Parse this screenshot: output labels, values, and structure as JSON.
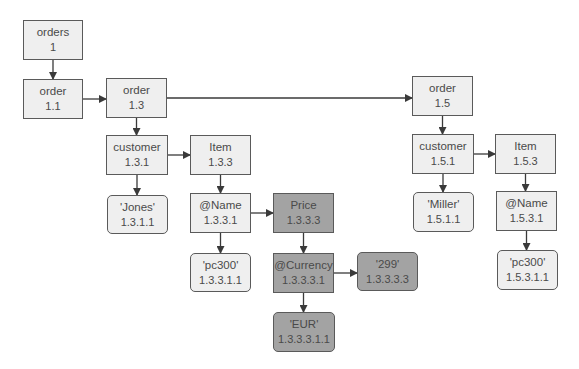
{
  "diagram": {
    "colors": {
      "node_fill": "#efefef",
      "highlight_fill": "#a3a3a3",
      "border": "#5a5a5a",
      "edge": "#3a3a3a"
    },
    "nodes": [
      {
        "key": "n1",
        "label": "orders",
        "id": "1",
        "kind": "element",
        "highlight": false,
        "x": 23,
        "y": 20,
        "w": 60,
        "h": 40
      },
      {
        "key": "n11",
        "label": "order",
        "id": "1.1",
        "kind": "element",
        "highlight": false,
        "x": 23,
        "y": 79,
        "w": 60,
        "h": 40
      },
      {
        "key": "n13",
        "label": "order",
        "id": "1.3",
        "kind": "element",
        "highlight": false,
        "x": 106,
        "y": 78,
        "w": 61,
        "h": 40
      },
      {
        "key": "n15",
        "label": "order",
        "id": "1.5",
        "kind": "element",
        "highlight": false,
        "x": 412,
        "y": 76,
        "w": 61,
        "h": 40
      },
      {
        "key": "n131",
        "label": "customer",
        "id": "1.3.1",
        "kind": "element",
        "highlight": false,
        "x": 106,
        "y": 135,
        "w": 62,
        "h": 40
      },
      {
        "key": "n133",
        "label": "Item",
        "id": "1.3.3",
        "kind": "element",
        "highlight": false,
        "x": 190,
        "y": 135,
        "w": 61,
        "h": 40
      },
      {
        "key": "n151",
        "label": "customer",
        "id": "1.5.1",
        "kind": "element",
        "highlight": false,
        "x": 412,
        "y": 134,
        "w": 62,
        "h": 40
      },
      {
        "key": "n153",
        "label": "Item",
        "id": "1.5.3",
        "kind": "element",
        "highlight": false,
        "x": 495,
        "y": 134,
        "w": 61,
        "h": 40
      },
      {
        "key": "n1311",
        "label": "'Jones'",
        "id": "1.3.1.1",
        "kind": "value",
        "highlight": false,
        "x": 107,
        "y": 195,
        "w": 61,
        "h": 39
      },
      {
        "key": "n1331",
        "label": "@Name",
        "id": "1.3.3.1",
        "kind": "element",
        "highlight": false,
        "x": 190,
        "y": 193,
        "w": 61,
        "h": 40
      },
      {
        "key": "n1333",
        "label": "Price",
        "id": "1.3.3.3",
        "kind": "element",
        "highlight": true,
        "x": 273,
        "y": 193,
        "w": 61,
        "h": 40
      },
      {
        "key": "n1511",
        "label": "'Miller'",
        "id": "1.5.1.1",
        "kind": "value",
        "highlight": false,
        "x": 413,
        "y": 192,
        "w": 61,
        "h": 40
      },
      {
        "key": "n1531",
        "label": "@Name",
        "id": "1.5.3.1",
        "kind": "element",
        "highlight": false,
        "x": 496,
        "y": 191,
        "w": 61,
        "h": 40
      },
      {
        "key": "n13311",
        "label": "'pc300'",
        "id": "1.3.3.1.1",
        "kind": "value",
        "highlight": false,
        "x": 190,
        "y": 253,
        "w": 61,
        "h": 39
      },
      {
        "key": "n13331",
        "label": "@Currency",
        "id": "1.3.3.3.1",
        "kind": "element",
        "highlight": true,
        "x": 273,
        "y": 253,
        "w": 61,
        "h": 40
      },
      {
        "key": "n13333",
        "label": "'299'",
        "id": "1.3.3.3.3",
        "kind": "value",
        "highlight": true,
        "x": 357,
        "y": 252,
        "w": 61,
        "h": 39
      },
      {
        "key": "n15311",
        "label": "'pc300'",
        "id": "1.5.3.1.1",
        "kind": "value",
        "highlight": false,
        "x": 497,
        "y": 250,
        "w": 61,
        "h": 40
      },
      {
        "key": "n133311",
        "label": "'EUR'",
        "id": "1.3.3.3.1.1",
        "kind": "value",
        "highlight": true,
        "x": 273,
        "y": 312,
        "w": 62,
        "h": 40
      }
    ],
    "edges": [
      {
        "from": "n1",
        "to": "n11",
        "dir": "down"
      },
      {
        "from": "n11",
        "to": "n13",
        "dir": "right"
      },
      {
        "from": "n13",
        "to": "n15",
        "dir": "right"
      },
      {
        "from": "n13",
        "to": "n131",
        "dir": "down"
      },
      {
        "from": "n131",
        "to": "n133",
        "dir": "right"
      },
      {
        "from": "n131",
        "to": "n1311",
        "dir": "down"
      },
      {
        "from": "n133",
        "to": "n1331",
        "dir": "down"
      },
      {
        "from": "n1331",
        "to": "n1333",
        "dir": "right"
      },
      {
        "from": "n1331",
        "to": "n13311",
        "dir": "down"
      },
      {
        "from": "n1333",
        "to": "n13331",
        "dir": "down"
      },
      {
        "from": "n13331",
        "to": "n13333",
        "dir": "right"
      },
      {
        "from": "n13331",
        "to": "n133311",
        "dir": "down"
      },
      {
        "from": "n15",
        "to": "n151",
        "dir": "down"
      },
      {
        "from": "n151",
        "to": "n153",
        "dir": "right"
      },
      {
        "from": "n151",
        "to": "n1511",
        "dir": "down"
      },
      {
        "from": "n153",
        "to": "n1531",
        "dir": "down"
      },
      {
        "from": "n1531",
        "to": "n15311",
        "dir": "down"
      }
    ]
  }
}
